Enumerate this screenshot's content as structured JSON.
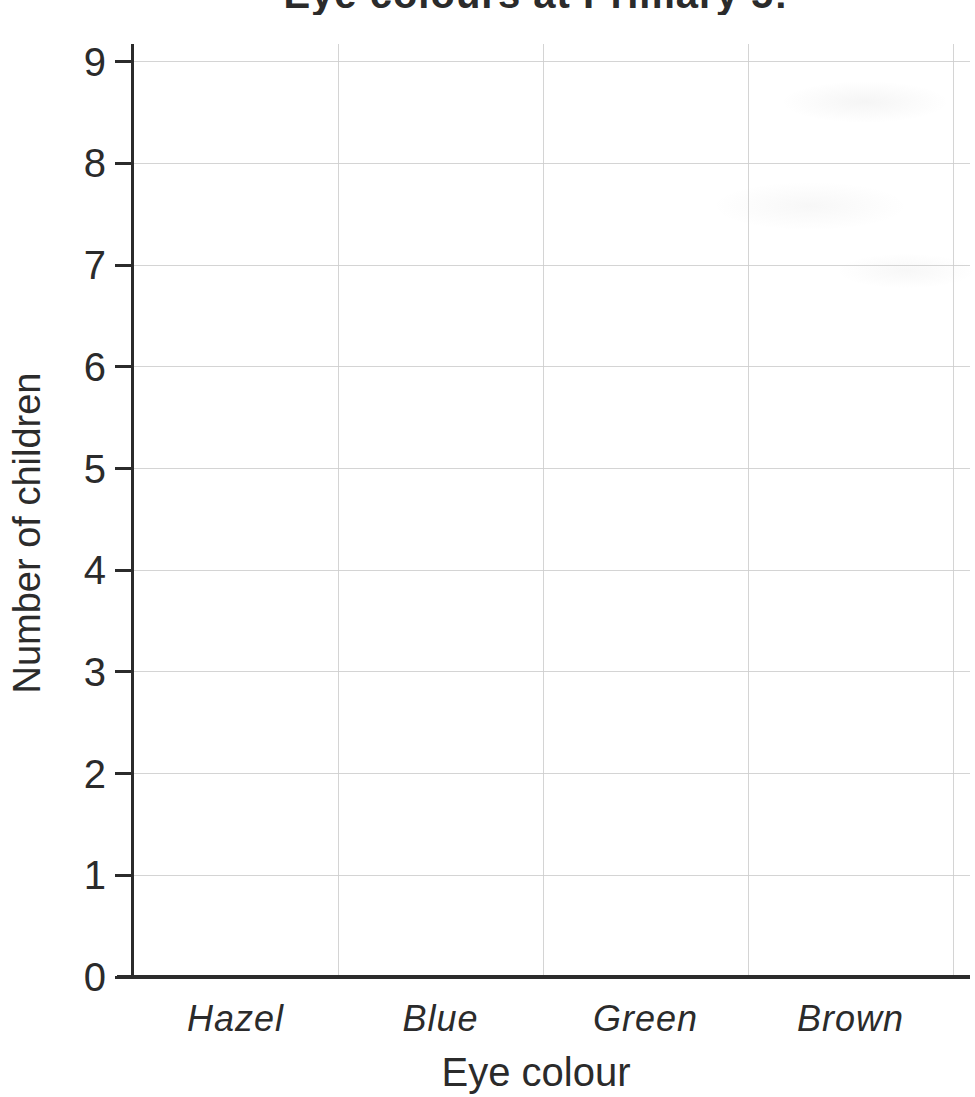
{
  "chart_data": {
    "type": "bar",
    "title": "Eye colours at Primary 5!",
    "title_clipped": true,
    "categories": [
      "Hazel",
      "Blue",
      "Green",
      "Brown"
    ],
    "values": [
      null,
      null,
      null,
      null
    ],
    "empty_template": true,
    "xlabel": "Eye colour",
    "ylabel": "Number of children",
    "ylim": [
      0,
      9
    ],
    "yticks": [
      0,
      1,
      2,
      3,
      4,
      5,
      6,
      7,
      8,
      9
    ],
    "grid": true,
    "legend": false
  },
  "colors": {
    "background": "#ffffff",
    "axis": "#2b2b2b",
    "text": "#2b2b2b",
    "gridline": "#cccccc"
  }
}
